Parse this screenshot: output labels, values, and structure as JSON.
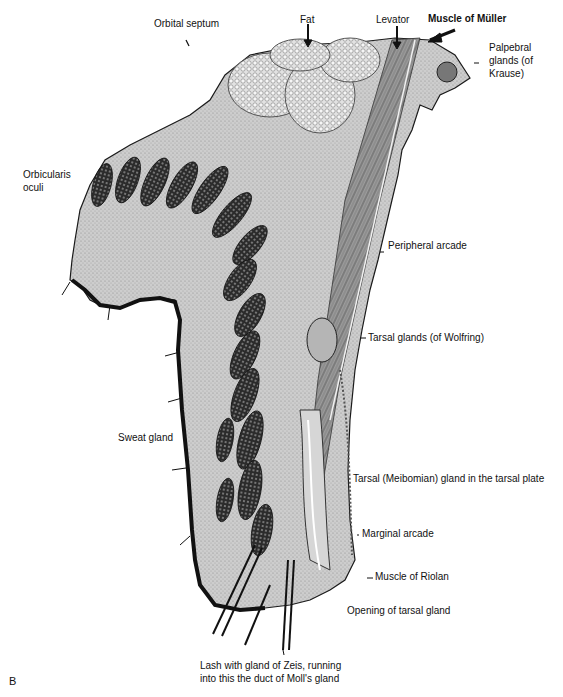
{
  "figure": {
    "panel_letter": "B"
  },
  "labels": {
    "orbital_septum": "Orbital septum",
    "fat": "Fat",
    "levator": "Levator",
    "muscle_of_muller": "Muscle of Müller",
    "palpebral_glands": "Palpebral glands (of Krause)",
    "orbicularis_oculi": "Orbicularis oculi",
    "peripheral_arcade": "Peripheral arcade",
    "tarsal_glands_wolfring": "Tarsal glands (of Wolfring)",
    "sweat_gland": "Sweat gland",
    "tarsal_meibomian": "Tarsal (Meibomian) gland in the tarsal plate",
    "marginal_arcade": "Marginal arcade",
    "muscle_of_riolan": "Muscle of Riolan",
    "opening_tarsal_gland": "Opening of tarsal gland",
    "lash_zeis_moll": "Lash with gland of Zeis, running into this the duct of Moll's gland"
  },
  "colors": {
    "tissue_fill": "#c9c9c9",
    "tissue_dark": "#2a2a2a",
    "muscle_bundle": "#3a3a3a",
    "fat_fill": "#dcdcdc",
    "background": "#ffffff"
  }
}
